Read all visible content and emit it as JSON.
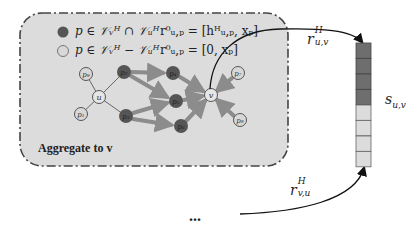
{
  "colors": {
    "panel_fill": "#dcdcdc",
    "panel_border": "#444444",
    "shared_node": "#555555",
    "unique_node": "#d8d8d8",
    "thick_edge": "#8c8c8c",
    "thin_edge": "#666666",
    "vector_dark": "#6e6e6e",
    "vector_light": "#dcdcdc",
    "curve": "#111111"
  },
  "legend": [
    {
      "type": "shared",
      "condition": "p ∈ 𝒱ᵥᴴ ∩ 𝒱ᵤᴴ",
      "init": "r⁰ᵤ,ₚ = [hᴴᵤ,ₚ, xₚ]"
    },
    {
      "type": "unique",
      "condition": "p ∈ 𝒱ᵥᴴ − 𝒱ᵤᴴ",
      "init": "r⁰ᵤ,ₚ = [0, xₚ]"
    }
  ],
  "panel_caption": "Aggregate to v",
  "nodes": [
    {
      "id": "p9",
      "label": "p₉",
      "kind": "unique",
      "x": 86,
      "y": 74
    },
    {
      "id": "p1",
      "label": "p₁",
      "kind": "unique",
      "x": 81,
      "y": 114
    },
    {
      "id": "u",
      "label": "u",
      "kind": "center",
      "x": 99,
      "y": 97
    },
    {
      "id": "p2",
      "label": "p₂",
      "kind": "shared",
      "x": 124,
      "y": 72
    },
    {
      "id": "p3",
      "label": "p₃",
      "kind": "shared",
      "x": 126,
      "y": 116
    },
    {
      "id": "p4",
      "label": "p₄",
      "kind": "shared",
      "x": 173,
      "y": 73
    },
    {
      "id": "p5",
      "label": "p₅",
      "kind": "shared",
      "x": 176,
      "y": 101
    },
    {
      "id": "p6",
      "label": "p₆",
      "kind": "shared",
      "x": 181,
      "y": 126
    },
    {
      "id": "v",
      "label": "v",
      "kind": "center",
      "x": 211,
      "y": 95
    },
    {
      "id": "p7",
      "label": "p₇",
      "kind": "unique",
      "x": 238,
      "y": 73
    },
    {
      "id": "p8",
      "label": "p₈",
      "kind": "unique",
      "x": 240,
      "y": 120
    }
  ],
  "vector": {
    "label": "s",
    "sub": "u,v",
    "cells": [
      "dark",
      "dark",
      "dark",
      "dark",
      "light",
      "light",
      "light",
      "light"
    ]
  },
  "arrows": {
    "top": {
      "label": "r",
      "sup": "H",
      "sub": "u,v"
    },
    "bottom": {
      "label": "r",
      "sup": "H",
      "sub": "v,u"
    }
  },
  "ellipsis": "..."
}
